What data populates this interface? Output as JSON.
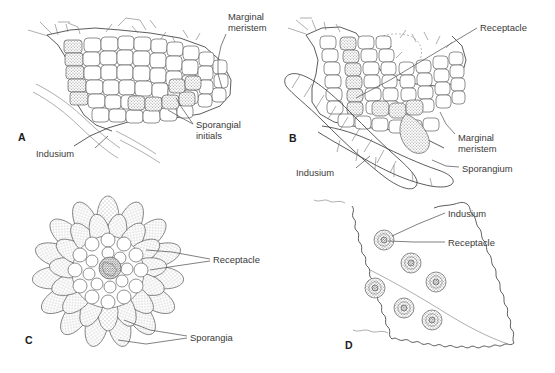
{
  "figure": {
    "type": "botanical-line-diagram",
    "panel_count": 4,
    "colors": {
      "ink": "#3f3f3f",
      "label_text": "#3a3a3a",
      "stipple_light": "#d8d8d8",
      "stipple_dark": "#9a9a9a",
      "background": "#ffffff"
    }
  },
  "panels": [
    {
      "id": "A",
      "letter": "A",
      "caption": "Leaf margin in section with sporangial initials",
      "labels": [
        {
          "text": "Marginal meristem",
          "lines": [
            "Marginal",
            "meristem"
          ],
          "x": 228,
          "y": 20
        },
        {
          "text": "Sporangial initials",
          "lines": [
            "Sporangial",
            "initials"
          ],
          "x": 196,
          "y": 125
        },
        {
          "text": "Indusium",
          "lines": [
            "Indusium"
          ],
          "x": 57,
          "y": 153
        }
      ]
    },
    {
      "id": "B",
      "letter": "B",
      "caption": "Later stage showing receptacle and young sporangium",
      "labels": [
        {
          "text": "Receptacle",
          "lines": [
            "Receptacle"
          ],
          "x": 480,
          "y": 28
        },
        {
          "text": "Marginal meristem",
          "lines": [
            "Marginal",
            "meristem"
          ],
          "x": 458,
          "y": 138
        },
        {
          "text": "Sporangium",
          "lines": [
            "Sporangium"
          ],
          "x": 462,
          "y": 168
        },
        {
          "text": "Indusium",
          "lines": [
            "Indusium"
          ],
          "x": 317,
          "y": 172
        }
      ]
    },
    {
      "id": "C",
      "letter": "C",
      "caption": "Surface view of sorus with radiating sporangia",
      "labels": [
        {
          "text": "Receptacle",
          "lines": [
            "Receptacle"
          ],
          "x": 213,
          "y": 260
        },
        {
          "text": "Sporangia",
          "lines": [
            "Sporangia"
          ],
          "x": 190,
          "y": 337
        }
      ]
    },
    {
      "id": "D",
      "letter": "D",
      "caption": "Leaf segment bearing six sori along the margin",
      "sori_count": 6,
      "labels": [
        {
          "text": "Indusium",
          "lines": [
            "Indusium"
          ],
          "x": 448,
          "y": 214
        },
        {
          "text": "Receptacle",
          "lines": [
            "Receptacle"
          ],
          "x": 448,
          "y": 243
        }
      ]
    }
  ]
}
